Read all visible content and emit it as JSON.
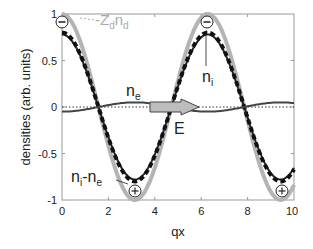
{
  "chart_data": {
    "type": "line",
    "title": "",
    "xlabel": "qx",
    "ylabel": "densities (arb. units)",
    "xlim": [
      0,
      10
    ],
    "ylim": [
      -1,
      1
    ],
    "x_ticks": [
      "0",
      "2",
      "4",
      "6",
      "8",
      "10"
    ],
    "y_ticks": [
      "1",
      "0.5",
      "0",
      "-0.5",
      "-1"
    ],
    "grid": false,
    "series": [
      {
        "name": "-Z_d n_d",
        "style": "solid light gray thick",
        "color": "#b0b0b0",
        "function": "cos(qx)",
        "amplitude": 1.0
      },
      {
        "name": "n_i",
        "style": "dashed black thick",
        "color": "#111111",
        "function": "0.8 cos(qx)",
        "amplitude": 0.8
      },
      {
        "name": "n_i - n_e",
        "style": "solid dark",
        "color": "#333333",
        "function": "0.78 cos(qx)",
        "amplitude": 0.78
      },
      {
        "name": "n_e",
        "style": "solid dark gray thin",
        "color": "#444444",
        "function": "-0.05 cos(qx)",
        "amplitude": -0.05
      },
      {
        "name": "zero",
        "style": "dotted",
        "color": "#333333",
        "function": "0"
      }
    ],
    "annotations": [
      {
        "text": "-Z_d n_d",
        "x": 1.0,
        "y": 0.93
      },
      {
        "text": "n_i",
        "x": 6.6,
        "y": 0.3
      },
      {
        "text": "n_e",
        "x": 3.0,
        "y": 0.12
      },
      {
        "text": "E",
        "x": 4.7,
        "y": -0.2
      },
      {
        "text": "n_i-n_e",
        "x": 0.9,
        "y": -0.72
      },
      {
        "text": "⊖",
        "x": 0.0,
        "y": 0.92
      },
      {
        "text": "⊖",
        "x": 6.28,
        "y": 0.92
      },
      {
        "text": "⊕",
        "x": 3.14,
        "y": -0.9
      },
      {
        "text": "⊕",
        "x": 9.42,
        "y": -0.9
      }
    ],
    "arrow_E": {
      "from_x": 3.6,
      "to_x": 5.1,
      "y": 0.0
    }
  },
  "labels": {
    "xlabel": "qx",
    "ylabel": "densities (arb. units)",
    "zdnd_main": "-Z",
    "zdnd_sub1": "d",
    "zdnd_n": "n",
    "zdnd_sub2": "d",
    "ni_main": "n",
    "ni_sub": "i",
    "ne_main": "n",
    "ne_sub": "e",
    "e_field": "E",
    "nine_n1": "n",
    "nine_s1": "i",
    "nine_dash": "-n",
    "nine_s2": "e",
    "minus_sym": "−",
    "plus_sym": "+"
  },
  "ticks": {
    "x": [
      "0",
      "2",
      "4",
      "6",
      "8",
      "10"
    ],
    "y": [
      "1",
      "0.5",
      "0",
      "-0.5",
      "-1"
    ]
  }
}
